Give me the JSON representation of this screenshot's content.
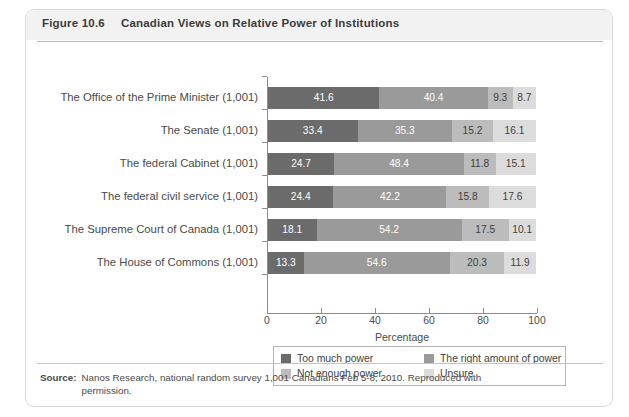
{
  "figure": {
    "number": "Figure 10.6",
    "title": "Canadian Views on Relative Power of Institutions"
  },
  "source": {
    "label": "Source:",
    "text": "Nanos Research, national random survey 1,001 Canadians Feb 5-8, 2010. Reproduced with permission."
  },
  "legend": {
    "items": [
      {
        "label": "Too much power",
        "color": "#6b6b6b"
      },
      {
        "label": "The right amount of power",
        "color": "#9a9a9a"
      },
      {
        "label": "Not enough power",
        "color": "#bcbcbc"
      },
      {
        "label": "Unsure",
        "color": "#dcdcdc"
      }
    ]
  },
  "chart_data": {
    "type": "bar",
    "orientation": "horizontal",
    "stacked": true,
    "title": "Canadian Views on Relative Power of Institutions",
    "xlabel": "Percentage",
    "ylabel": "",
    "xlim": [
      0,
      100
    ],
    "xticks": [
      0,
      20,
      40,
      60,
      80,
      100
    ],
    "grid": false,
    "legend_position": "bottom",
    "categories": [
      "The Office of the Prime Minister (1,001)",
      "The Senate (1,001)",
      "The federal Cabinet (1,001)",
      "The federal civil service (1,001)",
      "The Supreme Court of Canada (1,001)",
      "The House of Commons (1,001)"
    ],
    "series": [
      {
        "name": "Too much power",
        "color": "#6b6b6b",
        "values": [
          41.6,
          33.4,
          24.7,
          24.4,
          18.1,
          13.3
        ]
      },
      {
        "name": "The right amount of power",
        "color": "#9a9a9a",
        "values": [
          40.4,
          35.3,
          48.4,
          42.2,
          54.2,
          54.6
        ]
      },
      {
        "name": "Not enough power",
        "color": "#bcbcbc",
        "values": [
          9.3,
          15.2,
          11.8,
          15.8,
          17.5,
          20.3
        ]
      },
      {
        "name": "Unsure",
        "color": "#dcdcdc",
        "values": [
          8.7,
          16.1,
          15.1,
          17.6,
          10.1,
          11.9
        ]
      }
    ]
  }
}
